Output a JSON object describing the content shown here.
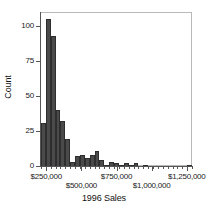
{
  "chart_data": {
    "type": "bar",
    "title": "",
    "subtitle": "",
    "xlabel": "1996 Sales",
    "ylabel": "Count",
    "grid": false,
    "legend": null,
    "xlim": [
      212500,
      1287500
    ],
    "ylim": [
      0,
      110
    ],
    "bin_width": 35000,
    "x_tick_labels": [
      "$250,000",
      "$500,000",
      "$750,000",
      "$1,000,000",
      "$1,250,000"
    ],
    "x_tick_values": [
      250000,
      500000,
      750000,
      1000000,
      1250000
    ],
    "x_tick_rows": [
      0,
      1,
      0,
      1,
      0
    ],
    "y_tick_labels": [
      "0",
      "25",
      "50",
      "75",
      "100"
    ],
    "y_tick_values": [
      0,
      25,
      50,
      75,
      100
    ],
    "bar_color": "#4a4a4a",
    "bar_edge_color": "#2e2e2e",
    "frame_color": "#b9b9b9",
    "axis_color": "#555555",
    "categories": [
      "230,000",
      "265,000",
      "300,000",
      "335,000",
      "370,000",
      "405,000",
      "440,000",
      "475,000",
      "510,000",
      "545,000",
      "580,000",
      "615,000",
      "650,000",
      "685,000",
      "720,000",
      "755,000",
      "790,000",
      "825,000",
      "860,000",
      "895,000",
      "930,000",
      "965,000",
      "1,000,000",
      "1,035,000",
      "1,070,000",
      "1,105,000",
      "1,140,000",
      "1,175,000",
      "1,210,000",
      "1,245,000",
      "1,280,000"
    ],
    "values": [
      31,
      105,
      93,
      40,
      32,
      19,
      3,
      7,
      8,
      6,
      8,
      11,
      4,
      1,
      3,
      2,
      1,
      2,
      1,
      2,
      0,
      1,
      0,
      0,
      0,
      0,
      0,
      0,
      0,
      0,
      1
    ]
  }
}
